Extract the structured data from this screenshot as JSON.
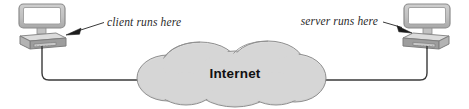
{
  "figure": {
    "type": "network-diagram",
    "width": 469,
    "height": 109,
    "background_color": "#ffffff"
  },
  "nodes": {
    "client": {
      "name": "client-computer",
      "icon": "desktop-computer-icon",
      "side": "left"
    },
    "server": {
      "name": "server-computer",
      "icon": "desktop-computer-icon",
      "side": "right"
    },
    "cloud": {
      "name": "internet-cloud",
      "label": "Internet",
      "fill_color": "#d4d4d4",
      "stroke_color": "#8a8a8a"
    }
  },
  "annotations": {
    "client_label": "client runs here",
    "server_label": "server runs here"
  },
  "links": {
    "client_link": {
      "name": "client-to-internet-link",
      "from": "client",
      "to": "cloud"
    },
    "server_link": {
      "name": "server-to-internet-link",
      "from": "cloud",
      "to": "server"
    }
  },
  "colors": {
    "line": "#3a3a3a",
    "cloud_fill": "#d4d4d4",
    "cloud_stroke": "#8a8a8a",
    "monitor_bezel": "#c3c3c3",
    "monitor_bezel_dark": "#9a9a9a",
    "screen": "#ffffff",
    "case_top": "#d6d6d6",
    "case_front": "#bdbdbd",
    "case_side": "#8f8f8f",
    "text": "#2a2a2a",
    "label_text": "#111111"
  }
}
